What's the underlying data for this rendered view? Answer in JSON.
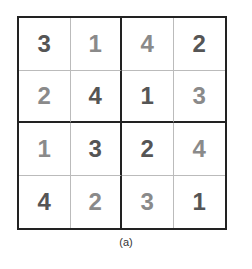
{
  "puzzle": {
    "size": 4,
    "cells": [
      [
        {
          "v": "3",
          "t": "given"
        },
        {
          "v": "1",
          "t": "filled"
        },
        {
          "v": "4",
          "t": "filled"
        },
        {
          "v": "2",
          "t": "given"
        }
      ],
      [
        {
          "v": "2",
          "t": "filled"
        },
        {
          "v": "4",
          "t": "given"
        },
        {
          "v": "1",
          "t": "given"
        },
        {
          "v": "3",
          "t": "filled"
        }
      ],
      [
        {
          "v": "1",
          "t": "filled"
        },
        {
          "v": "3",
          "t": "given"
        },
        {
          "v": "2",
          "t": "given"
        },
        {
          "v": "4",
          "t": "filled"
        }
      ],
      [
        {
          "v": "4",
          "t": "given"
        },
        {
          "v": "2",
          "t": "filled"
        },
        {
          "v": "3",
          "t": "filled"
        },
        {
          "v": "1",
          "t": "given"
        }
      ]
    ]
  },
  "caption": "(a)",
  "colors": {
    "given": "#555555",
    "filled": "#8a8a8a",
    "border": "#222222",
    "thin_line": "#bbbbbb"
  }
}
